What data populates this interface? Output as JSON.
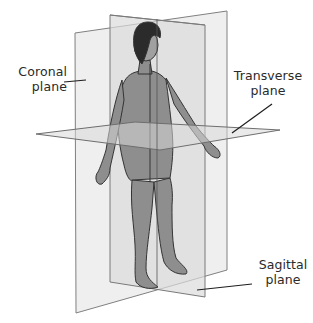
{
  "labels": {
    "coronal": {
      "line1": "Coronal",
      "line2": "plane"
    },
    "transverse": {
      "line1": "Transverse",
      "line2": "plane"
    },
    "sagittal": {
      "line1": "Sagittal",
      "line2": "plane"
    }
  },
  "planes": [
    {
      "name": "Coronal plane",
      "orientation": "frontal, divides front/back"
    },
    {
      "name": "Sagittal plane",
      "orientation": "vertical, divides left/right"
    },
    {
      "name": "Transverse plane",
      "orientation": "horizontal, divides upper/lower"
    }
  ],
  "colors": {
    "background": "#ffffff",
    "plane_fill": "#e9e9e9",
    "plane_stroke": "#7c7c7c",
    "body_fill": "#8c8c8c",
    "body_stroke": "#333333",
    "hair": "#2b2b2b",
    "text": "#2a2a2a"
  }
}
